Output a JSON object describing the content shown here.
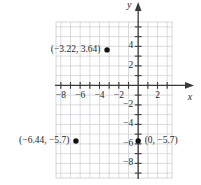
{
  "chart_data": {
    "type": "scatter",
    "title": "",
    "xlabel": "x",
    "ylabel": "y",
    "grid": true,
    "legend": null,
    "xlim": [
      -8.5,
      3.5
    ],
    "ylim": [
      -9.5,
      6.5
    ],
    "x_ticks": [
      -8,
      -6,
      -4,
      -2,
      2
    ],
    "y_ticks": [
      4,
      2,
      -2,
      -4,
      -6,
      -8
    ],
    "x_tick_labels": [
      "−8",
      "−6",
      "−4",
      "−2",
      "2"
    ],
    "y_tick_labels": [
      "4",
      "2",
      "−2",
      "−4",
      "−6",
      "−8"
    ],
    "tick_step": 1,
    "points": [
      {
        "label": "(−3.22, 3.64)",
        "x": -3.22,
        "y": 3.64,
        "label_side": "left"
      },
      {
        "label": "(−6.44, −5.7)",
        "x": -6.44,
        "y": -5.7,
        "label_side": "left"
      },
      {
        "label": "(0, −5.7)",
        "x": 0,
        "y": -5.7,
        "label_side": "right"
      }
    ]
  },
  "axes": {
    "x_axis_label": "x",
    "y_axis_label": "y"
  },
  "colors": {
    "grid": "#c8ccd2",
    "axis": "#3a3a3a",
    "point": "#111111",
    "text": "#1f1f1f",
    "background": "#ffffff"
  }
}
